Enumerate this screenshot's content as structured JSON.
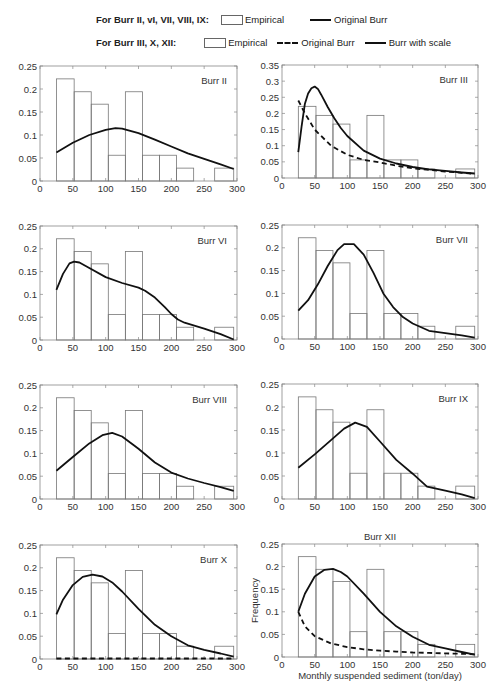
{
  "legend": {
    "row1": {
      "label": "For Burr II, vI, VII, VIII, IX:",
      "items": [
        {
          "kind": "box",
          "text": "Empirical"
        },
        {
          "kind": "solid",
          "text": "Original Burr"
        }
      ]
    },
    "row2": {
      "label": "For Burr III, X, XII:",
      "items": [
        {
          "kind": "box",
          "text": "Empirical"
        },
        {
          "kind": "dashed",
          "text": "Original Burr"
        },
        {
          "kind": "solid",
          "text": "Burr with scale"
        }
      ]
    }
  },
  "axes": {
    "xlabel": "Monthly suspended sediment (ton/day)",
    "ylabel": "Frequency"
  },
  "chart_data": [
    {
      "type": "bar",
      "title": "Burr II",
      "xlim": [
        0,
        300
      ],
      "ylim": [
        0,
        0.25
      ],
      "xticks": [
        0,
        50,
        100,
        150,
        200,
        250,
        300
      ],
      "yticks": [
        0,
        0.05,
        0.1,
        0.15,
        0.2,
        0.25
      ],
      "bins": [
        [
          25,
          52
        ],
        [
          52,
          78
        ],
        [
          78,
          104
        ],
        [
          104,
          130
        ],
        [
          130,
          156
        ],
        [
          156,
          182
        ],
        [
          182,
          208
        ],
        [
          208,
          234
        ],
        [
          234,
          266
        ],
        [
          266,
          295
        ]
      ],
      "empirical": [
        0.222,
        0.194,
        0.167,
        0.056,
        0.194,
        0.056,
        0.056,
        0.028,
        0,
        0.028
      ],
      "series": [
        {
          "name": "Original Burr",
          "style": "solid",
          "x": [
            25,
            50,
            75,
            100,
            115,
            125,
            150,
            175,
            200,
            225,
            250,
            275,
            295
          ],
          "y": [
            0.062,
            0.083,
            0.1,
            0.111,
            0.115,
            0.114,
            0.104,
            0.09,
            0.075,
            0.06,
            0.048,
            0.036,
            0.026
          ]
        }
      ]
    },
    {
      "type": "bar",
      "title": "Burr III",
      "xlim": [
        0,
        300
      ],
      "ylim": [
        0,
        0.35
      ],
      "xticks": [
        0,
        50,
        100,
        150,
        200,
        250,
        300
      ],
      "yticks": [
        0,
        0.05,
        0.1,
        0.15,
        0.2,
        0.25,
        0.3,
        0.35
      ],
      "bins": [
        [
          25,
          52
        ],
        [
          52,
          78
        ],
        [
          78,
          104
        ],
        [
          104,
          130
        ],
        [
          130,
          156
        ],
        [
          156,
          182
        ],
        [
          182,
          208
        ],
        [
          208,
          234
        ],
        [
          234,
          266
        ],
        [
          266,
          295
        ]
      ],
      "empirical": [
        0.222,
        0.194,
        0.167,
        0.056,
        0.194,
        0.056,
        0.056,
        0.028,
        0,
        0.028
      ],
      "series": [
        {
          "name": "Burr with scale",
          "style": "solid",
          "x": [
            25,
            30,
            35,
            40,
            45,
            50,
            55,
            60,
            70,
            80,
            90,
            100,
            125,
            150,
            175,
            200,
            225,
            250,
            275,
            295
          ],
          "y": [
            0.08,
            0.16,
            0.23,
            0.262,
            0.278,
            0.283,
            0.276,
            0.258,
            0.22,
            0.185,
            0.155,
            0.13,
            0.085,
            0.06,
            0.045,
            0.034,
            0.027,
            0.022,
            0.017,
            0.014
          ]
        },
        {
          "name": "Original Burr",
          "style": "dashed",
          "x": [
            25,
            35,
            50,
            75,
            100,
            125,
            150,
            175,
            200,
            225,
            250,
            275,
            295
          ],
          "y": [
            0.24,
            0.2,
            0.15,
            0.1,
            0.072,
            0.056,
            0.048,
            0.038,
            0.03,
            0.025,
            0.02,
            0.016,
            0.013
          ]
        }
      ]
    },
    {
      "type": "bar",
      "title": "Burr VI",
      "xlim": [
        0,
        300
      ],
      "ylim": [
        0,
        0.25
      ],
      "xticks": [
        0,
        50,
        100,
        150,
        200,
        250,
        300
      ],
      "yticks": [
        0,
        0.05,
        0.1,
        0.15,
        0.2,
        0.25
      ],
      "bins": [
        [
          25,
          52
        ],
        [
          52,
          78
        ],
        [
          78,
          104
        ],
        [
          104,
          130
        ],
        [
          130,
          156
        ],
        [
          156,
          182
        ],
        [
          182,
          208
        ],
        [
          208,
          234
        ],
        [
          234,
          266
        ],
        [
          266,
          295
        ]
      ],
      "empirical": [
        0.222,
        0.194,
        0.167,
        0.056,
        0.194,
        0.056,
        0.056,
        0.028,
        0,
        0.028
      ],
      "series": [
        {
          "name": "Original Burr",
          "style": "solid",
          "x": [
            25,
            35,
            45,
            52,
            60,
            75,
            100,
            125,
            150,
            160,
            175,
            190,
            200,
            210,
            220,
            250,
            275,
            295
          ],
          "y": [
            0.11,
            0.145,
            0.168,
            0.172,
            0.17,
            0.158,
            0.138,
            0.125,
            0.115,
            0.108,
            0.093,
            0.072,
            0.057,
            0.045,
            0.038,
            0.025,
            0.013,
            0.001
          ]
        }
      ]
    },
    {
      "type": "bar",
      "title": "Burr VII",
      "xlim": [
        0,
        300
      ],
      "ylim": [
        0,
        0.25
      ],
      "xticks": [
        0,
        50,
        100,
        150,
        200,
        250,
        300
      ],
      "yticks": [
        0,
        0.05,
        0.1,
        0.15,
        0.2,
        0.25
      ],
      "bins": [
        [
          25,
          52
        ],
        [
          52,
          78
        ],
        [
          78,
          104
        ],
        [
          104,
          130
        ],
        [
          130,
          156
        ],
        [
          156,
          182
        ],
        [
          182,
          208
        ],
        [
          208,
          234
        ],
        [
          234,
          266
        ],
        [
          266,
          295
        ]
      ],
      "empirical": [
        0.222,
        0.194,
        0.167,
        0.056,
        0.194,
        0.056,
        0.056,
        0.028,
        0,
        0.028
      ],
      "series": [
        {
          "name": "Original Burr",
          "style": "solid",
          "x": [
            25,
            40,
            55,
            70,
            85,
            95,
            110,
            125,
            140,
            155,
            170,
            185,
            200,
            225,
            250,
            275,
            295
          ],
          "y": [
            0.062,
            0.085,
            0.12,
            0.16,
            0.195,
            0.208,
            0.208,
            0.185,
            0.145,
            0.1,
            0.07,
            0.048,
            0.034,
            0.018,
            0.013,
            0.008,
            0.003
          ]
        }
      ]
    },
    {
      "type": "bar",
      "title": "Burr VIII",
      "xlim": [
        0,
        300
      ],
      "ylim": [
        0,
        0.25
      ],
      "xticks": [
        0,
        50,
        100,
        150,
        200,
        250,
        300
      ],
      "yticks": [
        0,
        0.05,
        0.1,
        0.15,
        0.2,
        0.25
      ],
      "bins": [
        [
          25,
          52
        ],
        [
          52,
          78
        ],
        [
          78,
          104
        ],
        [
          104,
          130
        ],
        [
          130,
          156
        ],
        [
          156,
          182
        ],
        [
          182,
          208
        ],
        [
          208,
          234
        ],
        [
          234,
          266
        ],
        [
          266,
          295
        ]
      ],
      "empirical": [
        0.222,
        0.194,
        0.167,
        0.056,
        0.194,
        0.056,
        0.056,
        0.028,
        0,
        0.028
      ],
      "series": [
        {
          "name": "Original Burr",
          "style": "solid",
          "x": [
            25,
            50,
            75,
            95,
            110,
            125,
            150,
            175,
            200,
            225,
            250,
            275,
            295
          ],
          "y": [
            0.062,
            0.092,
            0.122,
            0.14,
            0.145,
            0.137,
            0.11,
            0.08,
            0.058,
            0.045,
            0.035,
            0.026,
            0.018
          ]
        }
      ]
    },
    {
      "type": "bar",
      "title": "Burr IX",
      "xlim": [
        0,
        300
      ],
      "ylim": [
        0,
        0.25
      ],
      "xticks": [
        0,
        50,
        100,
        150,
        200,
        250,
        300
      ],
      "yticks": [
        0,
        0.05,
        0.1,
        0.15,
        0.2,
        0.25
      ],
      "bins": [
        [
          25,
          52
        ],
        [
          52,
          78
        ],
        [
          78,
          104
        ],
        [
          104,
          130
        ],
        [
          130,
          156
        ],
        [
          156,
          182
        ],
        [
          182,
          208
        ],
        [
          208,
          234
        ],
        [
          234,
          266
        ],
        [
          266,
          295
        ]
      ],
      "empirical": [
        0.222,
        0.194,
        0.167,
        0.056,
        0.194,
        0.056,
        0.056,
        0.028,
        0,
        0.028
      ],
      "series": [
        {
          "name": "Original Burr",
          "style": "solid",
          "x": [
            25,
            50,
            75,
            95,
            112,
            130,
            150,
            175,
            200,
            222,
            250,
            275,
            295
          ],
          "y": [
            0.068,
            0.097,
            0.128,
            0.153,
            0.166,
            0.157,
            0.125,
            0.085,
            0.055,
            0.027,
            0.018,
            0.01,
            0.002
          ]
        }
      ]
    },
    {
      "type": "bar",
      "title": "Burr X",
      "xlim": [
        0,
        300
      ],
      "ylim": [
        0,
        0.25
      ],
      "xticks": [
        0,
        50,
        100,
        150,
        200,
        250,
        300
      ],
      "yticks": [
        0,
        0.05,
        0.1,
        0.15,
        0.2,
        0.25
      ],
      "bins": [
        [
          25,
          52
        ],
        [
          52,
          78
        ],
        [
          78,
          104
        ],
        [
          104,
          130
        ],
        [
          130,
          156
        ],
        [
          156,
          182
        ],
        [
          182,
          208
        ],
        [
          208,
          234
        ],
        [
          234,
          266
        ],
        [
          266,
          295
        ]
      ],
      "empirical": [
        0.222,
        0.194,
        0.167,
        0.056,
        0.194,
        0.056,
        0.056,
        0.028,
        0,
        0.028
      ],
      "series": [
        {
          "name": "Burr with scale",
          "style": "solid",
          "x": [
            25,
            35,
            50,
            65,
            80,
            95,
            110,
            125,
            150,
            175,
            200,
            225,
            250,
            275,
            295
          ],
          "y": [
            0.098,
            0.13,
            0.162,
            0.18,
            0.185,
            0.181,
            0.168,
            0.148,
            0.11,
            0.075,
            0.05,
            0.03,
            0.02,
            0.012,
            0.005
          ]
        },
        {
          "name": "Original Burr",
          "style": "dashed",
          "x": [
            25,
            100,
            200,
            295
          ],
          "y": [
            0.001,
            0.001,
            0.001,
            0.001
          ]
        }
      ]
    },
    {
      "type": "bar",
      "title": "Burr XII",
      "xlabel": "Monthly suspended sediment (ton/day)",
      "ylabel": "Frequency",
      "xlim": [
        0,
        300
      ],
      "ylim": [
        0,
        0.25
      ],
      "xticks": [
        0,
        50,
        100,
        150,
        200,
        250,
        300
      ],
      "yticks": [
        0,
        0.05,
        0.1,
        0.15,
        0.2,
        0.25
      ],
      "bins": [
        [
          25,
          52
        ],
        [
          52,
          78
        ],
        [
          78,
          104
        ],
        [
          104,
          130
        ],
        [
          130,
          156
        ],
        [
          156,
          182
        ],
        [
          182,
          208
        ],
        [
          208,
          234
        ],
        [
          234,
          266
        ],
        [
          266,
          295
        ]
      ],
      "empirical": [
        0.222,
        0.194,
        0.167,
        0.056,
        0.194,
        0.056,
        0.056,
        0.028,
        0,
        0.028
      ],
      "series": [
        {
          "name": "Burr with scale",
          "style": "solid",
          "x": [
            25,
            35,
            50,
            65,
            78,
            90,
            100,
            125,
            150,
            175,
            200,
            225,
            250,
            275,
            295
          ],
          "y": [
            0.1,
            0.14,
            0.178,
            0.193,
            0.195,
            0.188,
            0.178,
            0.14,
            0.1,
            0.068,
            0.045,
            0.027,
            0.019,
            0.011,
            0.005
          ]
        },
        {
          "name": "Original Burr",
          "style": "dashed",
          "x": [
            25,
            35,
            50,
            75,
            100,
            125,
            150,
            175,
            200,
            225,
            250,
            275,
            295
          ],
          "y": [
            0.1,
            0.068,
            0.046,
            0.03,
            0.022,
            0.017,
            0.014,
            0.012,
            0.01,
            0.009,
            0.008,
            0.007,
            0.006
          ]
        }
      ]
    }
  ]
}
